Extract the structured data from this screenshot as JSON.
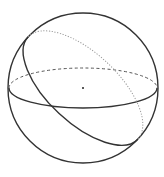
{
  "diagram": {
    "type": "sphere-great-circles",
    "colors": {
      "background": "#ffffff",
      "outline": "#333333",
      "front_stroke": "#333333",
      "equator_back": "#555555",
      "tilted_back": "#999999",
      "center_dot": "#222222"
    },
    "sphere": {
      "cx": 83,
      "cy": 88,
      "r": 75
    },
    "equator": {
      "rx": 74,
      "ry": 20,
      "front_style": "solid",
      "back_style": "dashed"
    },
    "tilted_circle": {
      "rx": 75,
      "ry": 35,
      "rotation_deg": 43,
      "front_style": "solid",
      "back_style": "dotted"
    },
    "center_point": {
      "label": "",
      "r": 1
    }
  }
}
